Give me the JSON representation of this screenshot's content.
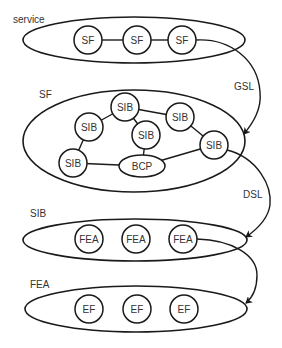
{
  "diagram": {
    "colors": {
      "stroke": "#1a1a1a",
      "text": "#333333",
      "background": "#ffffff"
    },
    "layers": [
      {
        "id": "service",
        "label": "service",
        "nodes": [
          "SF",
          "SF",
          "SF"
        ]
      },
      {
        "id": "sf",
        "label": "SF",
        "nodes": [
          "SIB",
          "SIB",
          "SIB",
          "SIB",
          "SIB",
          "SIB",
          "BCP"
        ]
      },
      {
        "id": "sib",
        "label": "SIB",
        "nodes": [
          "FEA",
          "FEA",
          "FEA"
        ]
      },
      {
        "id": "fea",
        "label": "FEA",
        "nodes": [
          "EF",
          "EF",
          "EF"
        ]
      }
    ],
    "links": [
      {
        "label": "GSL",
        "from": "service.SF[3]",
        "to": "SF layer"
      },
      {
        "label": "DSL",
        "from": "SF.SIB (right)",
        "to": "SIB layer"
      },
      {
        "label": "",
        "from": "SIB.FEA[3]",
        "to": "FEA layer"
      }
    ]
  }
}
